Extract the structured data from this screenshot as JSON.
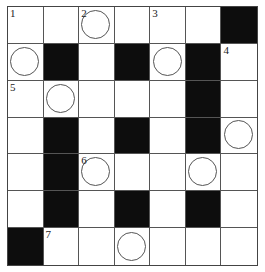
{
  "puzzle": {
    "type": "crossword",
    "rows": 7,
    "cols": 7,
    "grid": [
      [
        {
          "n": "1"
        },
        {},
        {
          "n": "2",
          "o": 1
        },
        {},
        {
          "n": "3"
        },
        {},
        {
          "b": 1
        }
      ],
      [
        {
          "o": 1
        },
        {
          "b": 1
        },
        {},
        {
          "b": 1
        },
        {
          "o": 1
        },
        {
          "b": 1
        },
        {
          "n": "4"
        }
      ],
      [
        {
          "n": "5"
        },
        {
          "o": 1
        },
        {},
        {},
        {},
        {
          "b": 1
        },
        {}
      ],
      [
        {},
        {
          "b": 1
        },
        {},
        {
          "b": 1
        },
        {},
        {
          "b": 1
        },
        {
          "o": 1
        }
      ],
      [
        {},
        {
          "b": 1
        },
        {
          "n": "6",
          "o": 1
        },
        {},
        {},
        {
          "o": 1
        },
        {}
      ],
      [
        {},
        {
          "b": 1
        },
        {},
        {
          "b": 1
        },
        {},
        {
          "b": 1
        },
        {}
      ],
      [
        {
          "b": 1
        },
        {
          "n": "7"
        },
        {},
        {
          "o": 1
        },
        {},
        {},
        {}
      ]
    ]
  }
}
